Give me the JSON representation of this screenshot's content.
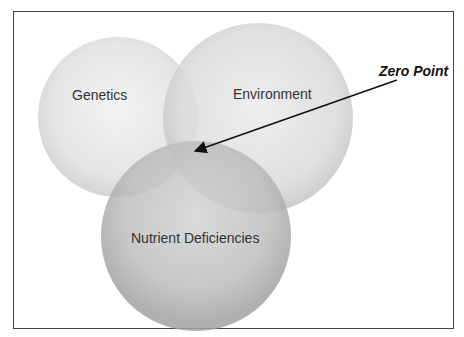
{
  "diagram": {
    "circles": [
      {
        "id": "genetics",
        "label": "Genetics",
        "cx": 118,
        "cy": 117,
        "r": 80
      },
      {
        "id": "environment",
        "label": "Environment",
        "cx": 258,
        "cy": 118,
        "r": 95
      },
      {
        "id": "nutrient",
        "label": "Nutrient Deficiencies",
        "cx": 196,
        "cy": 236,
        "r": 95
      }
    ],
    "annotation": {
      "label": "Zero Point",
      "arrow_from": [
        397,
        80
      ],
      "arrow_to": [
        193,
        152
      ]
    },
    "colors": {
      "frame": "#444444",
      "circle_light": "#e6e6e6",
      "circle_mid": "#c8c8c8",
      "circle_dark": "#a9a9a9",
      "text": "#333333"
    }
  }
}
